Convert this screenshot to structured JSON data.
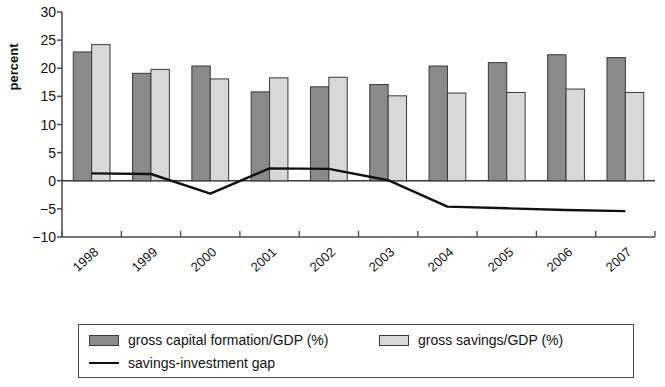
{
  "chart_data": {
    "type": "bar",
    "title": "",
    "subtitle": "",
    "xlabel": "",
    "ylabel": "percent",
    "categories": [
      "1998",
      "1999",
      "2000",
      "2001",
      "2002",
      "2003",
      "2004",
      "2005",
      "2006",
      "2007"
    ],
    "ylim": [
      -10,
      30
    ],
    "ytick_labels": [
      "30",
      "25",
      "20",
      "15",
      "10",
      "5",
      "0",
      "−5",
      "−10"
    ],
    "ytick_values": [
      30,
      25,
      20,
      15,
      10,
      5,
      0,
      -5,
      -10
    ],
    "grid": false,
    "legend_position": "bottom",
    "series": [
      {
        "name": "gross capital formation/GDP (%)",
        "type": "bar",
        "color": "#8a8a8a",
        "values": [
          22.9,
          19.1,
          20.4,
          15.8,
          16.7,
          17.1,
          20.4,
          21.0,
          22.4,
          21.9
        ]
      },
      {
        "name": "gross savings/GDP (%)",
        "type": "bar",
        "color": "#d8d8d8",
        "values": [
          24.2,
          19.8,
          18.1,
          18.3,
          18.4,
          15.1,
          15.6,
          15.7,
          16.3,
          15.7
        ]
      },
      {
        "name": "savings-investment gap",
        "type": "line",
        "color": "#111111",
        "values": [
          1.3,
          1.2,
          -2.3,
          2.2,
          2.1,
          0.1,
          -4.6,
          -4.9,
          -5.2,
          -5.4
        ]
      }
    ]
  },
  "legend": {
    "items": [
      {
        "label": "gross capital formation/GDP (%)",
        "marker": "dark-swatch"
      },
      {
        "label": "gross savings/GDP (%)",
        "marker": "light-swatch"
      },
      {
        "label": "savings-investment gap",
        "marker": "line-sample"
      }
    ]
  },
  "colors": {
    "series_1": "#8a8a8a",
    "series_2": "#d8d8d8",
    "line": "#111111",
    "axis": "#4a4a4a",
    "background": "#ffffff"
  }
}
